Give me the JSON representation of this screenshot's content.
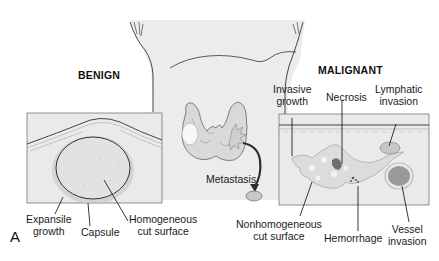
{
  "figure": {
    "panel_letter": "A"
  },
  "benign": {
    "title": "BENIGN",
    "labels": {
      "expansile_growth": [
        "Expansile",
        "growth"
      ],
      "capsule": "Capsule",
      "homogeneous_cut_surface": [
        "Homogeneous",
        "cut surface"
      ]
    }
  },
  "center": {
    "labels": {
      "metastasis": "Metastasis"
    }
  },
  "malignant": {
    "title": "MALIGNANT",
    "labels": {
      "invasive_growth": [
        "Invasive",
        "growth"
      ],
      "necrosis": "Necrosis",
      "lymphatic_invasion": [
        "Lymphatic",
        "invasion"
      ],
      "nonhomogeneous_cut_surface": [
        "Nonhomogeneous",
        "cut surface"
      ],
      "hemorrhage": "Hemorrhage",
      "vessel_invasion": [
        "Vessel",
        "invasion"
      ]
    }
  },
  "colors": {
    "background": "#ffffff",
    "neck_fill": "#ececec",
    "panel_fill": "#e9e9e9",
    "line": "#2a2a2a",
    "nodule_fill": "#dcdcdc",
    "hemorrhage": "#7a7a7a",
    "vessel_fill": "#9a9a9a"
  }
}
